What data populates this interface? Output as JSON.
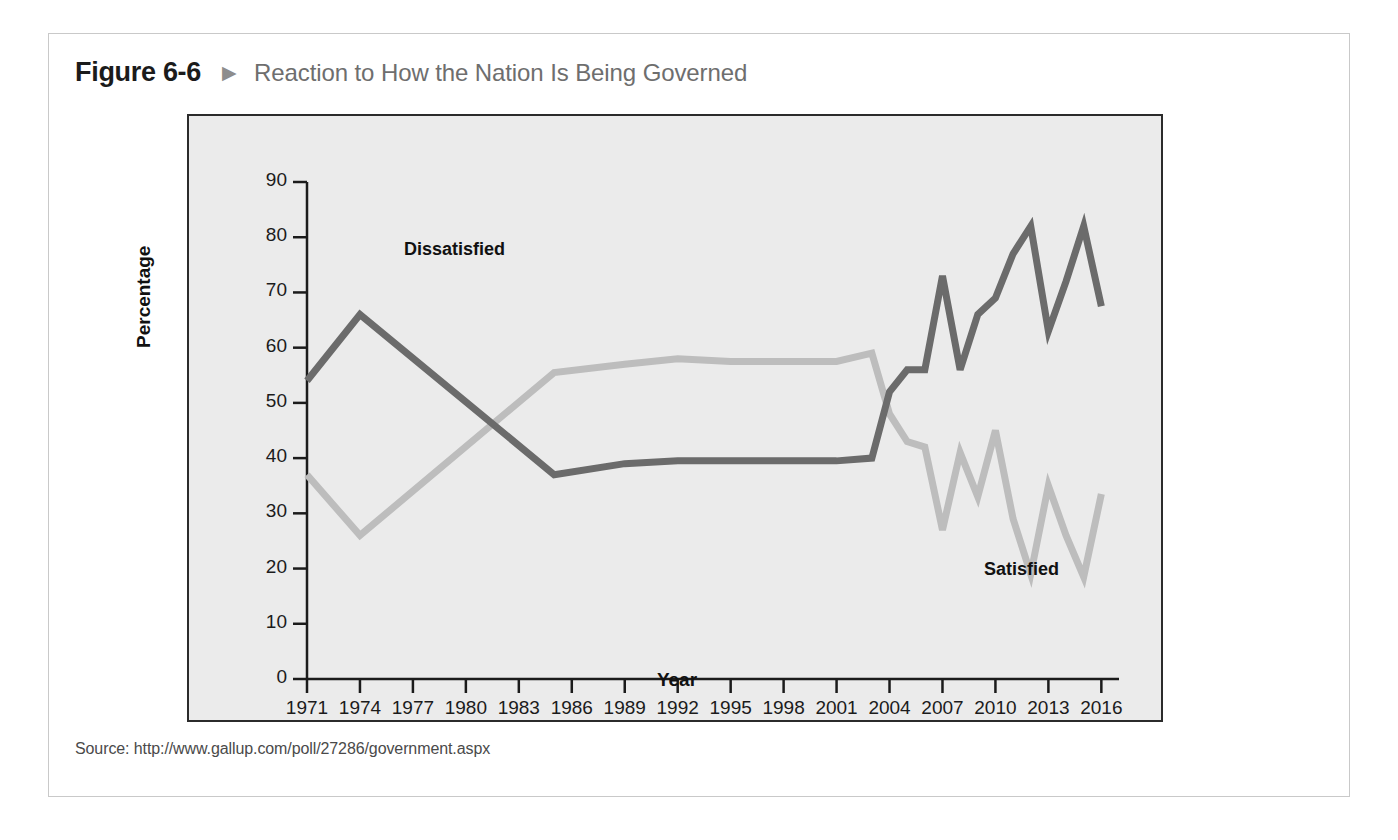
{
  "figure": {
    "number": "Figure 6-6",
    "arrow_icon": "triangle-right-icon",
    "arrow_glyph": "▶",
    "title": "Reaction to How the Nation Is Being Governed",
    "source": "Source: http://www.gallup.com/poll/27286/government.aspx"
  },
  "colors": {
    "dissatisfied": "#6b6b6b",
    "satisfied": "#bdbdbd",
    "plot_background": "#ebebeb",
    "plot_border": "#2b2b2b",
    "card_border": "#c9c9c9",
    "title_text": "#6e6e6e",
    "number_text": "#1b1b1b"
  },
  "chart_data": {
    "type": "line",
    "title": "Reaction to How the Nation Is Being Governed",
    "xlabel": "Year",
    "ylabel": "Percentage",
    "xlim": [
      1971,
      2017
    ],
    "ylim": [
      0,
      90
    ],
    "ytick_labels": [
      "0",
      "10",
      "20",
      "30",
      "40",
      "50",
      "60",
      "70",
      "80",
      "90"
    ],
    "yticks": [
      0,
      10,
      20,
      30,
      40,
      50,
      60,
      70,
      80,
      90
    ],
    "xtick_labels": [
      "1971",
      "1974",
      "1977",
      "1980",
      "1983",
      "1986",
      "1989",
      "1992",
      "1995",
      "1998",
      "2001",
      "2004",
      "2007",
      "2010",
      "2013",
      "2016"
    ],
    "xticks": [
      1971,
      1974,
      1977,
      1980,
      1983,
      1986,
      1989,
      1992,
      1995,
      1998,
      2001,
      2004,
      2007,
      2010,
      2013,
      2016
    ],
    "grid": false,
    "legend": "inline-annotations",
    "annotations": [
      {
        "text": "Dissatisfied",
        "x": 1977,
        "y": 77
      },
      {
        "text": "Satisfied",
        "x": 2008,
        "y": 21
      }
    ],
    "series": [
      {
        "name": "Dissatisfied",
        "color": "#6b6b6b",
        "x": [
          1971,
          1974,
          1985,
          1989,
          1992,
          1995,
          1998,
          2001,
          2003,
          2004,
          2005,
          2006,
          2007,
          2008,
          2009,
          2010,
          2011,
          2012,
          2013,
          2014,
          2015,
          2016
        ],
        "y": [
          54,
          66,
          37,
          39,
          39.5,
          39.5,
          39.5,
          39.5,
          40,
          52,
          56,
          56,
          73,
          56,
          66,
          69,
          77,
          82,
          63,
          72,
          82,
          67.5
        ]
      },
      {
        "name": "Satisfied",
        "color": "#bdbdbd",
        "x": [
          1971,
          1974,
          1985,
          1989,
          1992,
          1995,
          1998,
          2001,
          2003,
          2004,
          2005,
          2006,
          2007,
          2008,
          2009,
          2010,
          2011,
          2012,
          2013,
          2014,
          2015,
          2016
        ],
        "y": [
          37,
          26,
          55.5,
          57,
          58,
          57.5,
          57.5,
          57.5,
          59,
          48,
          43,
          42,
          27,
          41,
          33,
          45,
          29,
          19,
          35,
          26,
          18.5,
          33.5
        ]
      }
    ]
  }
}
